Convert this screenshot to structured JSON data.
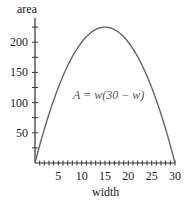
{
  "chart_data": {
    "type": "line",
    "title": "",
    "xlabel": "width",
    "ylabel": "area",
    "annotation": "A = w(30 − w)",
    "xlim": [
      0,
      30
    ],
    "ylim": [
      0,
      240
    ],
    "x_ticks": [
      5,
      10,
      15,
      20,
      25,
      30
    ],
    "x_tick_labels": [
      "5",
      "10",
      "15",
      "20",
      "25",
      "30"
    ],
    "x_minor_step": 1,
    "y_ticks": [
      50,
      100,
      150,
      200
    ],
    "y_tick_labels": [
      "50",
      "100",
      "150",
      "200"
    ],
    "y_minor_step": 25,
    "grid": false,
    "series": [
      {
        "name": "A = w(30 - w)",
        "x": [
          0,
          2.5,
          5,
          7.5,
          10,
          12.5,
          15,
          17.5,
          20,
          22.5,
          25,
          27.5,
          30
        ],
        "values": [
          0,
          68.75,
          125,
          168.75,
          200,
          218.75,
          225,
          218.75,
          200,
          168.75,
          125,
          68.75,
          0
        ]
      }
    ]
  }
}
